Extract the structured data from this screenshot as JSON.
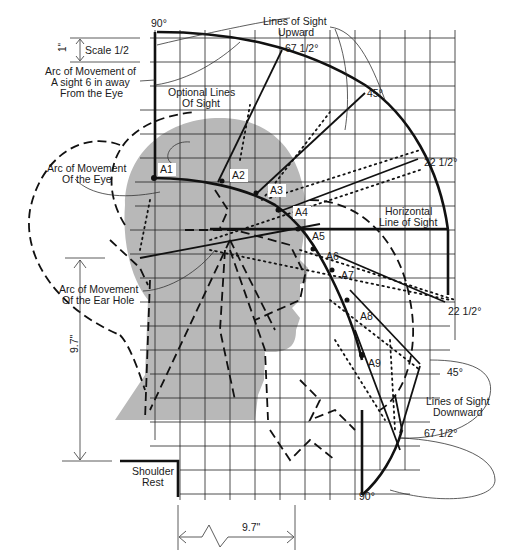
{
  "figure": {
    "scale": {
      "label": "Scale 1/2",
      "unit_mark": "1\""
    },
    "colors": {
      "line": "#111111",
      "head_fill": "#b8b8b8",
      "grid": "#222222",
      "background": "#ffffff"
    }
  },
  "labels": {
    "angle_top_90": "90°",
    "angle_bottom_90": "90°",
    "angle_up_67": "67 1/2°",
    "angle_up_45": "45°",
    "angle_up_22": "22 1/2°",
    "angle_down_22": "22 1/2°",
    "angle_down_45": "45°",
    "angle_down_67": "67 1/2°",
    "lines_up_1": "Lines of Sight",
    "lines_up_2": "Upward",
    "lines_down_1": "Lines of Sight",
    "lines_down_2": "Downward",
    "horizontal_1": "Horizontal",
    "horizontal_2": "Line of Sight",
    "optional_1": "Optional Lines",
    "optional_2": "Of Sight",
    "arc6_1": "Arc of Movement of",
    "arc6_2": "A sight 6 in away",
    "arc6_3": "From the Eye",
    "arc_eye_1": "Arc of Movement",
    "arc_eye_2": "Of the Eye",
    "arc_ear_1": "Arc of Movement",
    "arc_ear_2": "Of the Ear Hole",
    "shoulder_1": "Shoulder",
    "shoulder_2": "Rest",
    "dim_vertical": "9.7\"",
    "dim_horizontal": "9.7\""
  },
  "points": [
    {
      "id": "A1",
      "label": "A1"
    },
    {
      "id": "A2",
      "label": "A2"
    },
    {
      "id": "A3",
      "label": "A3"
    },
    {
      "id": "A4",
      "label": "A4"
    },
    {
      "id": "A5",
      "label": "A5"
    },
    {
      "id": "A6",
      "label": "A6"
    },
    {
      "id": "A7",
      "label": "A7"
    },
    {
      "id": "A8",
      "label": "A8"
    },
    {
      "id": "A9",
      "label": "A9"
    }
  ]
}
